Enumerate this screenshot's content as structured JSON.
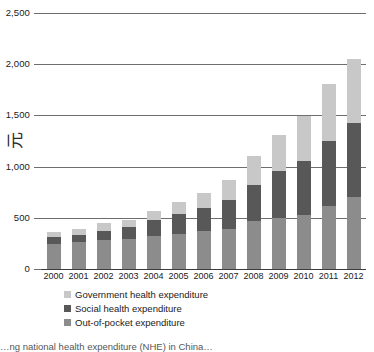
{
  "chart_data": {
    "type": "bar",
    "stacked": true,
    "title": "",
    "subtitle": "",
    "xlabel": "",
    "ylabel": "元",
    "ylim": [
      0,
      2500
    ],
    "ytick_labels": [
      "0",
      "500",
      "1,000",
      "1,500",
      "2,000",
      "2,500"
    ],
    "ytick_values": [
      0,
      500,
      1000,
      1500,
      2000,
      2500
    ],
    "grid": true,
    "legend_position": "bottom-left",
    "categories": [
      "2000",
      "2001",
      "2002",
      "2003",
      "2004",
      "2005",
      "2006",
      "2007",
      "2008",
      "2009",
      "2010",
      "2011",
      "2012"
    ],
    "series": [
      {
        "name": "Out-of-pocket expenditure",
        "color": "#8c8c8c",
        "values": [
          245,
          260,
          280,
          295,
          325,
          345,
          370,
          390,
          470,
          495,
          525,
          615,
          700
        ]
      },
      {
        "name": "Social health expenditure",
        "color": "#585858",
        "values": [
          65,
          75,
          90,
          120,
          155,
          190,
          230,
          285,
          350,
          460,
          530,
          640,
          730
        ]
      },
      {
        "name": "Government health expenditure",
        "color": "#c8c8c8",
        "values": [
          50,
          55,
          75,
          65,
          90,
          120,
          140,
          190,
          280,
          355,
          435,
          555,
          620
        ]
      }
    ],
    "totals": [
      360,
      390,
      445,
      480,
      570,
      655,
      740,
      865,
      1100,
      1310,
      1490,
      1810,
      2050
    ]
  },
  "yaxis": {
    "unit_label": "元"
  },
  "legend": {
    "items": [
      {
        "label": "Government health expenditure",
        "color": "#c8c8c8"
      },
      {
        "label": "Social health expenditure",
        "color": "#585858"
      },
      {
        "label": "Out-of-pocket expenditure",
        "color": "#8c8c8c"
      }
    ]
  },
  "caption": {
    "text": "…ng national health expenditure (NHE) in China…"
  }
}
